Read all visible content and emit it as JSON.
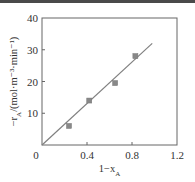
{
  "chart_data": {
    "type": "scatter",
    "title": "",
    "xlabel": "1−x",
    "xlabel_sub": "A",
    "ylabel": "−r",
    "ylabel_sub": "A",
    "ylabel_units": "/(mol·m⁻³·min⁻¹)",
    "xlim": [
      0,
      1.2
    ],
    "ylim": [
      0,
      40
    ],
    "xticks": [
      0,
      0.4,
      0.8,
      1.2
    ],
    "xtick_labels": [
      "0",
      "0.4",
      "0.8",
      "1.2"
    ],
    "yticks": [
      10,
      20,
      30,
      40
    ],
    "ytick_labels": [
      "10",
      "20",
      "30",
      "40"
    ],
    "grid": false,
    "legend": null,
    "series": [
      {
        "name": "measured",
        "kind": "scatter",
        "marker": "square",
        "x": [
          0.24,
          0.42,
          0.65,
          0.83
        ],
        "y": [
          6.0,
          14.0,
          19.5,
          28.0
        ]
      },
      {
        "name": "fit",
        "kind": "line",
        "x": [
          0,
          0.98
        ],
        "y": [
          0,
          32
        ]
      }
    ],
    "colors": {
      "marker": "#888888",
      "line": "#808080",
      "frame": "#666666"
    }
  }
}
